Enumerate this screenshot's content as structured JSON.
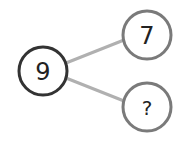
{
  "diagram": {
    "type": "number-bond",
    "whole": {
      "value": "9",
      "stroke": "#333333"
    },
    "parts": [
      {
        "value": "7",
        "stroke": "#7a7a7a"
      },
      {
        "value": "?",
        "stroke": "#7a7a7a"
      }
    ],
    "connector_color": "#b0b0b0",
    "background": "#ffffff"
  }
}
